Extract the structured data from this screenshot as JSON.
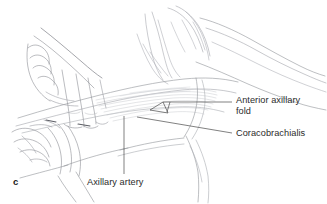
{
  "figure": {
    "letter": "c",
    "domain_kind": "anatomical-line-illustration",
    "background_color": "#ffffff",
    "line_color": "#8d8f96",
    "leader_line_color": "#4a4a4a",
    "text_color": "#2b2b2b"
  },
  "labels": {
    "anterior_axillary_fold": {
      "text": "Anterior axillary\nfold",
      "line1": "Anterior axillary",
      "line2": "fold"
    },
    "coracobrachialis": {
      "text": "Coracobrachialis"
    },
    "axillary_artery": {
      "text": "Axillary artery"
    }
  }
}
